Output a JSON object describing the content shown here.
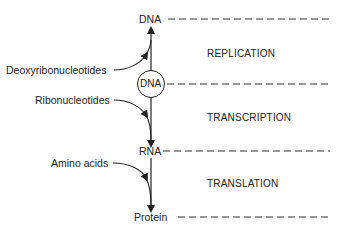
{
  "diagram": {
    "nodes": {
      "dna_top": "DNA",
      "dna_circle": "DNA",
      "rna": "RNA",
      "protein": "Protein"
    },
    "inputs": {
      "deoxyribonucleotides": "Deoxyribonucleotides",
      "ribonucleotides": "Ribonucleotides",
      "amino_acids": "Amino acids"
    },
    "stages": {
      "replication": "REPLICATION",
      "transcription": "TRANSCRIPTION",
      "translation": "TRANSLATION"
    },
    "colors": {
      "ink": "#222222",
      "background": "#ffffff"
    }
  }
}
